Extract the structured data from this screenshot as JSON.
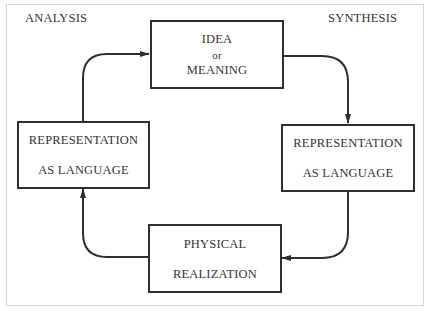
{
  "diagram": {
    "corner_labels": {
      "top_left": "ANALYSIS",
      "top_right": "SYNTHESIS"
    },
    "nodes": [
      {
        "id": "idea-meaning",
        "position": "top",
        "lines": [
          "IDEA",
          "or",
          "MEANING"
        ]
      },
      {
        "id": "representation-synthesis",
        "position": "right",
        "lines": [
          "REPRESENTATION",
          "AS LANGUAGE"
        ]
      },
      {
        "id": "physical-realization",
        "position": "bottom",
        "lines": [
          "PHYSICAL",
          "REALIZATION"
        ]
      },
      {
        "id": "representation-analysis",
        "position": "left",
        "lines": [
          "REPRESENTATION",
          "AS LANGUAGE"
        ]
      }
    ],
    "edges": [
      {
        "from": "idea-meaning",
        "to": "representation-synthesis",
        "direction": "clockwise"
      },
      {
        "from": "representation-synthesis",
        "to": "physical-realization",
        "direction": "clockwise"
      },
      {
        "from": "physical-realization",
        "to": "representation-analysis",
        "direction": "clockwise"
      },
      {
        "from": "representation-analysis",
        "to": "idea-meaning",
        "direction": "clockwise"
      }
    ],
    "colors": {
      "stroke": "#2e2e2e",
      "frame": "#d6d6d6",
      "background": "#ffffff"
    }
  }
}
